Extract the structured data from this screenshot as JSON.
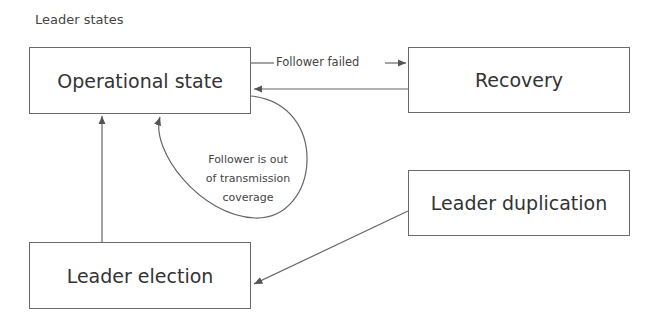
{
  "diagram": {
    "title": "Leader states",
    "nodes": [
      {
        "id": "operational",
        "label": "Operational state"
      },
      {
        "id": "recovery",
        "label": "Recovery"
      },
      {
        "id": "leader_duplication",
        "label": "Leader duplication"
      },
      {
        "id": "leader_election",
        "label": "Leader election"
      }
    ],
    "edges": [
      {
        "from": "operational",
        "to": "recovery",
        "label": "Follower failed"
      },
      {
        "from": "recovery",
        "to": "operational",
        "label": ""
      },
      {
        "from": "operational",
        "to": "operational",
        "label": "Follower is out of transmission coverage"
      },
      {
        "from": "leader_election",
        "to": "operational",
        "label": ""
      },
      {
        "from": "leader_duplication",
        "to": "leader_election",
        "label": ""
      }
    ],
    "self_loop_lines": [
      "Follower is out",
      "of transmission",
      "coverage"
    ]
  }
}
